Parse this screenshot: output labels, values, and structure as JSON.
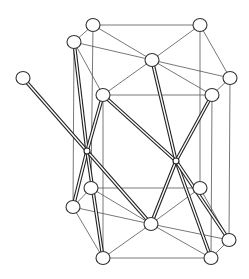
{
  "figure": {
    "type": "crystal-structure",
    "colors": {
      "background": "#ffffff",
      "line": "#555555",
      "rod": "#222222",
      "atom_fill": "#ffffff"
    }
  },
  "atoms": [
    {
      "id": "A1",
      "x": 93,
      "y": 25,
      "r": 6.5
    },
    {
      "id": "A2",
      "x": 200,
      "y": 25,
      "r": 6.5
    },
    {
      "id": "A3",
      "x": 74,
      "y": 42,
      "r": 6.5
    },
    {
      "id": "A4",
      "x": 152,
      "y": 60,
      "r": 6.5
    },
    {
      "id": "A5",
      "x": 230,
      "y": 78,
      "r": 6.5
    },
    {
      "id": "A6",
      "x": 103,
      "y": 95,
      "r": 6.5
    },
    {
      "id": "A7",
      "x": 212,
      "y": 95,
      "r": 6.5
    },
    {
      "id": "A8",
      "x": 23,
      "y": 78,
      "r": 6.5
    },
    {
      "id": "B1",
      "x": 91,
      "y": 188,
      "r": 6.5
    },
    {
      "id": "B2",
      "x": 200,
      "y": 188,
      "r": 6.5
    },
    {
      "id": "B3",
      "x": 73,
      "y": 207,
      "r": 6.5
    },
    {
      "id": "B4",
      "x": 151,
      "y": 224,
      "r": 6.5
    },
    {
      "id": "B5",
      "x": 229,
      "y": 240,
      "r": 6.5
    },
    {
      "id": "B6",
      "x": 103,
      "y": 258,
      "r": 6.5
    },
    {
      "id": "B7",
      "x": 211,
      "y": 258,
      "r": 6.5
    }
  ],
  "centers": [
    {
      "id": "C1",
      "x": 87,
      "y": 151,
      "r": 3
    },
    {
      "id": "C2",
      "x": 176,
      "y": 161,
      "r": 3
    }
  ],
  "edges": [
    [
      "A1",
      "A2"
    ],
    [
      "A1",
      "A3"
    ],
    [
      "A1",
      "A4"
    ],
    [
      "A2",
      "A4"
    ],
    [
      "A3",
      "A4"
    ],
    [
      "A2",
      "A5"
    ],
    [
      "A4",
      "A5"
    ],
    [
      "A4",
      "A6"
    ],
    [
      "A4",
      "A7"
    ],
    [
      "A3",
      "A6"
    ],
    [
      "A6",
      "A7"
    ],
    [
      "A5",
      "A7"
    ],
    [
      "B1",
      "B2"
    ],
    [
      "B1",
      "B3"
    ],
    [
      "B1",
      "B4"
    ],
    [
      "B2",
      "B4"
    ],
    [
      "B3",
      "B4"
    ],
    [
      "B3",
      "B6"
    ],
    [
      "B4",
      "B6"
    ],
    [
      "B4",
      "B7"
    ],
    [
      "B4",
      "B5"
    ],
    [
      "B6",
      "B7"
    ],
    [
      "B5",
      "B7"
    ],
    [
      "B2",
      "B5"
    ],
    [
      "A1",
      "B1"
    ],
    [
      "A2",
      "B2"
    ],
    [
      "A3",
      "B3"
    ],
    [
      "A6",
      "B6"
    ],
    [
      "A7",
      "B7"
    ],
    [
      "A5",
      "B5"
    ]
  ],
  "rods": [
    [
      "C1",
      "A8"
    ],
    [
      "C1",
      "A3"
    ],
    [
      "C1",
      "A6"
    ],
    [
      "C1",
      "B3"
    ],
    [
      "C1",
      "B6"
    ],
    [
      "C1",
      "B4"
    ],
    [
      "C2",
      "A4"
    ],
    [
      "C2",
      "A7"
    ],
    [
      "C2",
      "B4"
    ],
    [
      "C2",
      "B7"
    ],
    [
      "C2",
      "B5"
    ],
    [
      "C2",
      "A6"
    ]
  ]
}
